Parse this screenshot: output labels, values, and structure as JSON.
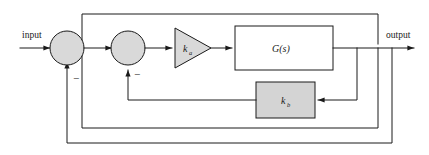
{
  "diagram": {
    "type": "control-block-diagram",
    "width": 429,
    "height": 155,
    "background_color": "#ffffff"
  },
  "labels": {
    "input": "input",
    "output": "output"
  },
  "blocks": {
    "summing_junction_1": {
      "name": "summing-junction-1",
      "shape": "circle",
      "fill_color": "#d9d9d9",
      "border_color": "#1a1a1a",
      "sign_label": "−"
    },
    "summing_junction_2": {
      "name": "summing-junction-2",
      "shape": "circle",
      "fill_color": "#d9d9d9",
      "border_color": "#1a1a1a",
      "sign_label": "−"
    },
    "amplifier": {
      "name": "amplifier-ka",
      "shape": "triangle",
      "fill_color": "#d9d9d9",
      "border_color": "#1a1a1a",
      "symbol": "k",
      "subscript": "a"
    },
    "plant": {
      "name": "plant-gs",
      "shape": "rectangle",
      "fill_color": "#ffffff",
      "border_color": "#1a1a1a",
      "label": "G(s)"
    },
    "feedback_gain": {
      "name": "feedback-gain-kb",
      "shape": "rectangle",
      "fill_color": "#d4d4d4",
      "border_color": "#1a1a1a",
      "symbol": "k",
      "subscript": "b"
    }
  },
  "signal_paths": {
    "forward": "input → sum1 → sum2 → ka → G(s) → output",
    "inner_loop": "output tap → sum1 (negative)",
    "outer_loop": "output tap → sum1 (negative)",
    "gain_loop": "output tap → kb → sum2 (negative)"
  },
  "colors": {
    "line": "#1a1a1a",
    "gray_fill": "#d9d9d9",
    "block_fill": "#d4d4d4",
    "white_fill": "#ffffff"
  }
}
